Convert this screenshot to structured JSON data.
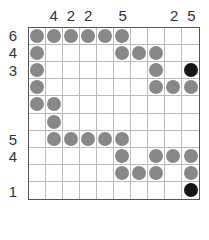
{
  "puzzle": {
    "rows": 10,
    "cols": 10,
    "column_clues": [
      "",
      "4",
      "2",
      "2",
      "",
      "5",
      "",
      "",
      "2",
      "5"
    ],
    "row_clues": [
      "6",
      "4",
      "3",
      "",
      "",
      "",
      "5",
      "4",
      "",
      "1"
    ],
    "cells": [
      [
        "g",
        "g",
        "g",
        "g",
        "g",
        "g",
        "",
        "",
        "",
        ""
      ],
      [
        "g",
        "",
        "",
        "",
        "",
        "g",
        "g",
        "g",
        "",
        ""
      ],
      [
        "g",
        "",
        "",
        "",
        "",
        "",
        "",
        "g",
        "",
        "b"
      ],
      [
        "g",
        "",
        "",
        "",
        "",
        "",
        "",
        "g",
        "g",
        "g"
      ],
      [
        "g",
        "g",
        "",
        "",
        "",
        "",
        "",
        "",
        "",
        ""
      ],
      [
        "",
        "g",
        "",
        "",
        "",
        "",
        "",
        "",
        "",
        ""
      ],
      [
        "",
        "g",
        "g",
        "g",
        "g",
        "g",
        "",
        "",
        "",
        ""
      ],
      [
        "",
        "",
        "",
        "",
        "",
        "g",
        "",
        "g",
        "g",
        "g"
      ],
      [
        "",
        "",
        "",
        "",
        "",
        "g",
        "g",
        "g",
        "",
        "g"
      ],
      [
        "",
        "",
        "",
        "",
        "",
        "",
        "",
        "",
        "",
        "b"
      ]
    ],
    "colors": {
      "g": "#888888",
      "b": "#151515",
      "grid_line": "#bbbbbb",
      "border": "#555555"
    }
  }
}
